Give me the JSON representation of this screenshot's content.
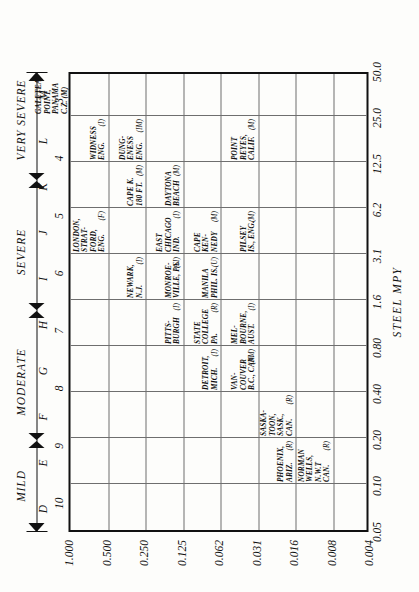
{
  "axes": {
    "x_title": "STEEL  MPY",
    "x_ticks": [
      "0.05",
      "0.10",
      "0.20",
      "0.40",
      "0.80",
      "1.6",
      "3.1",
      "6.2",
      "12.5",
      "25.0",
      "50.0"
    ],
    "y_ticks": [
      "0.004",
      "0.008",
      "0.016",
      "0.031",
      "0.062",
      "0.125",
      "0.250",
      "0.500",
      "1.000"
    ],
    "letter_ticks": [
      "D",
      "E",
      "F",
      "G",
      "H",
      "I",
      "J",
      "K",
      "L",
      "M"
    ],
    "number_ticks": [
      "3",
      "4",
      "5",
      "6",
      "7",
      "8",
      "9",
      "10"
    ]
  },
  "severity": {
    "bands": [
      {
        "label": "MILD",
        "from": "D",
        "to": "F"
      },
      {
        "label": "MODERATE",
        "from": "F",
        "to": "I"
      },
      {
        "label": "SEVERE",
        "from": "I",
        "to": "L"
      },
      {
        "label": "VERY SEVERE",
        "from": "L",
        "to": "M"
      }
    ]
  },
  "chart_data": {
    "type": "scatter",
    "title": "",
    "xlabel": "STEEL  MPY",
    "ylabel": "",
    "grid": true,
    "legend": "none",
    "xlim": [
      "0.05",
      "50.0"
    ],
    "ylim": [
      "0.004",
      "1.000"
    ],
    "x_ticks": [
      "0.05",
      "0.10",
      "0.20",
      "0.40",
      "0.80",
      "1.6",
      "3.1",
      "6.2",
      "12.5",
      "25.0",
      "50.0"
    ],
    "y_ticks": [
      "0.004",
      "0.008",
      "0.016",
      "0.031",
      "0.062",
      "0.125",
      "0.250",
      "0.500",
      "1.000"
    ],
    "severity_letters": [
      "D",
      "E",
      "F",
      "G",
      "H",
      "I",
      "J",
      "K",
      "L",
      "M"
    ],
    "severity_numbers": [
      "3",
      "4",
      "5",
      "6",
      "7",
      "8",
      "9",
      "10"
    ],
    "points": [
      {
        "name": "GALETEA\nPOINT,\nPANAMA\nC.Z. (M)",
        "code": "",
        "col": 9,
        "row": 8,
        "letter": "M",
        "number": "10"
      },
      {
        "name": "WIDNESS\nENG.",
        "code": "(I)",
        "col": 8,
        "row": 7,
        "letter": "L",
        "number": "9"
      },
      {
        "name": "DUNG-\nENESS\nENG.",
        "code": "(IM)",
        "col": 8,
        "row": 6,
        "letter": "L",
        "number": "8"
      },
      {
        "name": "POINT\nREYES,\nCALIF.",
        "code": "(M)",
        "col": 8,
        "row": 3,
        "letter": "L",
        "number": "6"
      },
      {
        "name": "CAPE K.\n180 FT.",
        "code": "(M)",
        "col": 7,
        "row": 6,
        "letter": "K",
        "number": "8"
      },
      {
        "name": "DAYTONA\nBEACH",
        "code": "(M)",
        "col": 7,
        "row": 5,
        "letter": "K",
        "number": "7"
      },
      {
        "name": "LONDON,\nSTRAT-\nFORD,\nENG.",
        "code": "(F)",
        "col": 6,
        "row": 7,
        "letter": "J",
        "number": "9"
      },
      {
        "name": "EAST\nCHICAGO\nIND.",
        "code": "(I)",
        "col": 6,
        "row": 5,
        "letter": "J",
        "number": "7"
      },
      {
        "name": "CAPE\nKEN-\nNEDY",
        "code": "(M)",
        "col": 6,
        "row": 4,
        "letter": "J",
        "number": "6"
      },
      {
        "name": "PILSEY\nIS., ENG.",
        "code": "(M)",
        "col": 6,
        "row": 3,
        "letter": "J",
        "number": "5"
      },
      {
        "name": "NEWARK,\nN.J.",
        "code": "(I)",
        "col": 5,
        "row": 6,
        "letter": "I",
        "number": "8"
      },
      {
        "name": "MONROE-\nVILLE, PA.",
        "code": "(SI)",
        "col": 5,
        "row": 5,
        "letter": "I",
        "number": "7"
      },
      {
        "name": "MANILA\nPHIL. IS.",
        "code": "(U)",
        "col": 5,
        "row": 4,
        "letter": "I",
        "number": "6"
      },
      {
        "name": "PITTS-\nBURGH",
        "code": "(I)",
        "col": 4,
        "row": 5,
        "letter": "H",
        "number": "7"
      },
      {
        "name": "STATE\nCOLLEGE\nPA.",
        "code": "(R)",
        "col": 4,
        "row": 4,
        "letter": "H",
        "number": "6"
      },
      {
        "name": "MEL-\nBOURNE,\nAUST.",
        "code": "(I)",
        "col": 4,
        "row": 3,
        "letter": "H",
        "number": "5"
      },
      {
        "name": "DETROIT,\nMICH.",
        "code": "(I)",
        "col": 3,
        "row": 4,
        "letter": "G",
        "number": "6"
      },
      {
        "name": "VAN-\nCOUVER\nB.C., CAN.",
        "code": "(RM)",
        "col": 3,
        "row": 3,
        "letter": "G",
        "number": "5"
      },
      {
        "name": "PHOENIX,\nARIZ.",
        "code": "(R)",
        "col": 1,
        "row": 2,
        "letter": "E",
        "number": "4"
      },
      {
        "name": "SASKA-\nTOON,\nSASK.,\nCAN.",
        "code": "(R)",
        "col": 2,
        "row": 2,
        "letter": "F",
        "number": "4"
      },
      {
        "name": "NORMAN\nWELLS,\nN.W.T\nCAN.",
        "code": "(R)",
        "col": 1,
        "row": 1,
        "letter": "E",
        "number": "3"
      }
    ]
  }
}
